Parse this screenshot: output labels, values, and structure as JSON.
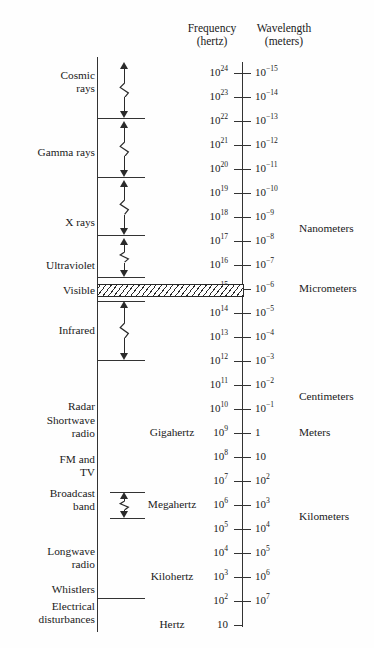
{
  "headers": {
    "frequency": "Frequency",
    "frequency_unit": "(hertz)",
    "wavelength": "Wavelength",
    "wavelength_unit": "(meters)"
  },
  "chart_data": {
    "type": "diagram",
    "orientation": "vertical",
    "axes": [
      {
        "name": "frequency",
        "label": "Frequency",
        "unit": "hertz",
        "side": "left",
        "scale": "log10",
        "ticks": [
          "10^24",
          "10^23",
          "10^22",
          "10^21",
          "10^20",
          "10^19",
          "10^18",
          "10^17",
          "10^16",
          "10^15",
          "10^14",
          "10^13",
          "10^12",
          "10^11",
          "10^10",
          "10^9",
          "10^8",
          "10^7",
          "10^6",
          "10^5",
          "10^4",
          "10^3",
          "10^2",
          "10"
        ]
      },
      {
        "name": "wavelength",
        "label": "Wavelength",
        "unit": "meters",
        "side": "right",
        "scale": "log10",
        "ticks": [
          "10^-15",
          "10^-14",
          "10^-13",
          "10^-12",
          "10^-11",
          "10^-10",
          "10^-9",
          "10^-8",
          "10^-7",
          "10^-6",
          "10^-5",
          "10^-4",
          "10^-3",
          "10^-2",
          "10^-1",
          "1",
          "10",
          "10^2",
          "10^3",
          "10^4",
          "10^5",
          "10^6",
          "10^7"
        ]
      }
    ],
    "frequency_labels": [
      {
        "text": "10",
        "exp": "24",
        "y": 73
      },
      {
        "text": "10",
        "exp": "23",
        "y": 97
      },
      {
        "text": "10",
        "exp": "22",
        "y": 121
      },
      {
        "text": "10",
        "exp": "21",
        "y": 145
      },
      {
        "text": "10",
        "exp": "20",
        "y": 169
      },
      {
        "text": "10",
        "exp": "19",
        "y": 193
      },
      {
        "text": "10",
        "exp": "18",
        "y": 217
      },
      {
        "text": "10",
        "exp": "17",
        "y": 241
      },
      {
        "text": "10",
        "exp": "16",
        "y": 265
      },
      {
        "text": "10",
        "exp": "15",
        "y": 289
      },
      {
        "text": "10",
        "exp": "14",
        "y": 313
      },
      {
        "text": "10",
        "exp": "13",
        "y": 337
      },
      {
        "text": "10",
        "exp": "12",
        "y": 361
      },
      {
        "text": "10",
        "exp": "11",
        "y": 385
      },
      {
        "text": "10",
        "exp": "10",
        "y": 409
      },
      {
        "text": "10",
        "exp": "9",
        "y": 433
      },
      {
        "text": "10",
        "exp": "8",
        "y": 457
      },
      {
        "text": "10",
        "exp": "7",
        "y": 481
      },
      {
        "text": "10",
        "exp": "6",
        "y": 505
      },
      {
        "text": "10",
        "exp": "5",
        "y": 529
      },
      {
        "text": "10",
        "exp": "4",
        "y": 553
      },
      {
        "text": "10",
        "exp": "3",
        "y": 577
      },
      {
        "text": "10",
        "exp": "2",
        "y": 601
      },
      {
        "text": "10",
        "exp": "",
        "y": 625
      }
    ],
    "wavelength_labels": [
      {
        "text": "10",
        "exp": "-15",
        "y": 73
      },
      {
        "text": "10",
        "exp": "-14",
        "y": 97
      },
      {
        "text": "10",
        "exp": "-13",
        "y": 121
      },
      {
        "text": "10",
        "exp": "-12",
        "y": 145
      },
      {
        "text": "10",
        "exp": "-11",
        "y": 169
      },
      {
        "text": "10",
        "exp": "-10",
        "y": 193
      },
      {
        "text": "10",
        "exp": "-9",
        "y": 217
      },
      {
        "text": "10",
        "exp": "-8",
        "y": 241
      },
      {
        "text": "10",
        "exp": "-7",
        "y": 265
      },
      {
        "text": "10",
        "exp": "-6",
        "y": 289
      },
      {
        "text": "10",
        "exp": "-5",
        "y": 313
      },
      {
        "text": "10",
        "exp": "-4",
        "y": 337
      },
      {
        "text": "10",
        "exp": "-3",
        "y": 361
      },
      {
        "text": "10",
        "exp": "-2",
        "y": 385
      },
      {
        "text": "10",
        "exp": "-1",
        "y": 409
      },
      {
        "text": "1",
        "exp": "",
        "y": 433
      },
      {
        "text": "10",
        "exp": "",
        "y": 457
      },
      {
        "text": "10",
        "exp": "2",
        "y": 481
      },
      {
        "text": "10",
        "exp": "3",
        "y": 505
      },
      {
        "text": "10",
        "exp": "4",
        "y": 529
      },
      {
        "text": "10",
        "exp": "5",
        "y": 553
      },
      {
        "text": "10",
        "exp": "6",
        "y": 577
      },
      {
        "text": "10",
        "exp": "7",
        "y": 601
      }
    ],
    "bands": [
      {
        "name": "Cosmic rays",
        "lines": [
          "Cosmic",
          "rays"
        ],
        "y": 82
      },
      {
        "name": "Gamma rays",
        "lines": [
          "Gamma rays"
        ],
        "y": 152
      },
      {
        "name": "X rays",
        "lines": [
          "X rays"
        ],
        "y": 222
      },
      {
        "name": "Ultraviolet",
        "lines": [
          "Ultraviolet"
        ],
        "y": 265
      },
      {
        "name": "Visible",
        "lines": [
          "Visible"
        ],
        "y": 290
      },
      {
        "name": "Infrared",
        "lines": [
          "Infrared"
        ],
        "y": 330
      },
      {
        "name": "Radar",
        "lines": [
          "Radar"
        ],
        "y": 406
      },
      {
        "name": "Shortwave radio",
        "lines": [
          "Shortwave",
          "radio"
        ],
        "y": 427
      },
      {
        "name": "FM and TV",
        "lines": [
          "FM and",
          "TV"
        ],
        "y": 466
      },
      {
        "name": "Broadcast band",
        "lines": [
          "Broadcast",
          "band"
        ],
        "y": 500
      },
      {
        "name": "Longwave radio",
        "lines": [
          "Longwave",
          "radio"
        ],
        "y": 558
      },
      {
        "name": "Whistlers",
        "lines": [
          "Whistlers"
        ],
        "y": 589
      },
      {
        "name": "Electrical disturbances",
        "lines": [
          "Electrical",
          "disturbances"
        ],
        "y": 613
      }
    ],
    "frequency_units": [
      {
        "label": "Gigahertz",
        "y": 433
      },
      {
        "label": "Megahertz",
        "y": 505
      },
      {
        "label": "Kilohertz",
        "y": 577
      },
      {
        "label": "Hertz",
        "y": 625
      }
    ],
    "wavelength_units": [
      {
        "label": "Nanometers",
        "y": 229
      },
      {
        "label": "Micrometers",
        "y": 289
      },
      {
        "label": "Centimeters",
        "y": 397
      },
      {
        "label": "Meters",
        "y": 433
      },
      {
        "label": "Kilometers",
        "y": 517
      }
    ],
    "separators": [
      {
        "y": 118,
        "x": 97,
        "w": 48
      },
      {
        "y": 177,
        "x": 97,
        "w": 48
      },
      {
        "y": 235,
        "x": 97,
        "w": 48
      },
      {
        "y": 277,
        "x": 97,
        "w": 48
      },
      {
        "y": 301,
        "x": 97,
        "w": 48
      },
      {
        "y": 360,
        "x": 97,
        "w": 48
      },
      {
        "y": 492,
        "x": 110,
        "w": 35
      },
      {
        "y": 518,
        "x": 110,
        "w": 35
      },
      {
        "y": 598,
        "x": 97,
        "w": 48
      }
    ],
    "visible_band": {
      "label": "Visible",
      "y": 289,
      "x": 97,
      "width": 145,
      "height": 11,
      "hatched": true
    },
    "extent_arrows": [
      {
        "band": "Cosmic rays",
        "top": 62,
        "bottom": 118
      },
      {
        "band": "Gamma rays",
        "top": 121,
        "bottom": 177
      },
      {
        "band": "X rays",
        "top": 180,
        "bottom": 235
      },
      {
        "band": "Ultraviolet",
        "top": 238,
        "bottom": 277
      },
      {
        "band": "Infrared",
        "top": 301,
        "bottom": 360
      },
      {
        "band": "Broadcast band",
        "top": 492,
        "bottom": 518
      }
    ]
  }
}
